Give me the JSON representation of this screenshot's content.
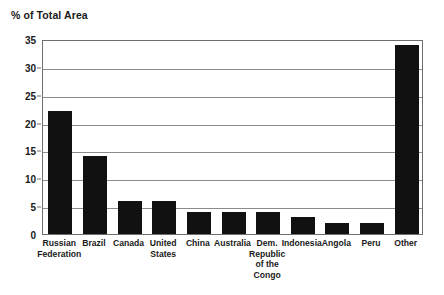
{
  "chart_data": {
    "type": "bar",
    "title": "% of Total Area",
    "xlabel": "",
    "ylabel": "% of Total Area",
    "ylim": [
      0,
      35
    ],
    "ytick_values": [
      0,
      5,
      10,
      15,
      20,
      25,
      30,
      35
    ],
    "ytick_labels": [
      "0",
      "5",
      "10",
      "15",
      "20",
      "25",
      "30",
      "35"
    ],
    "grid": true,
    "legend": false,
    "bar_color": "#111111",
    "categories": [
      "Russian Federation",
      "Brazil",
      "Canada",
      "United States",
      "China",
      "Australia",
      "Dem. Republic of the Congo",
      "Indonesia",
      "Angola",
      "Peru",
      "Other"
    ],
    "category_label_lines": [
      [
        "Russian",
        "Federation"
      ],
      [
        "Brazil"
      ],
      [
        "Canada"
      ],
      [
        "United",
        "States"
      ],
      [
        "China"
      ],
      [
        "Australia"
      ],
      [
        "Dem.",
        "Republic",
        "of the",
        "Congo"
      ],
      [
        "Indonesia"
      ],
      [
        "Angola"
      ],
      [
        "Peru"
      ],
      [
        "Other"
      ]
    ],
    "values": [
      22,
      14,
      6,
      6,
      4,
      4,
      4,
      3,
      2,
      2,
      34
    ]
  }
}
